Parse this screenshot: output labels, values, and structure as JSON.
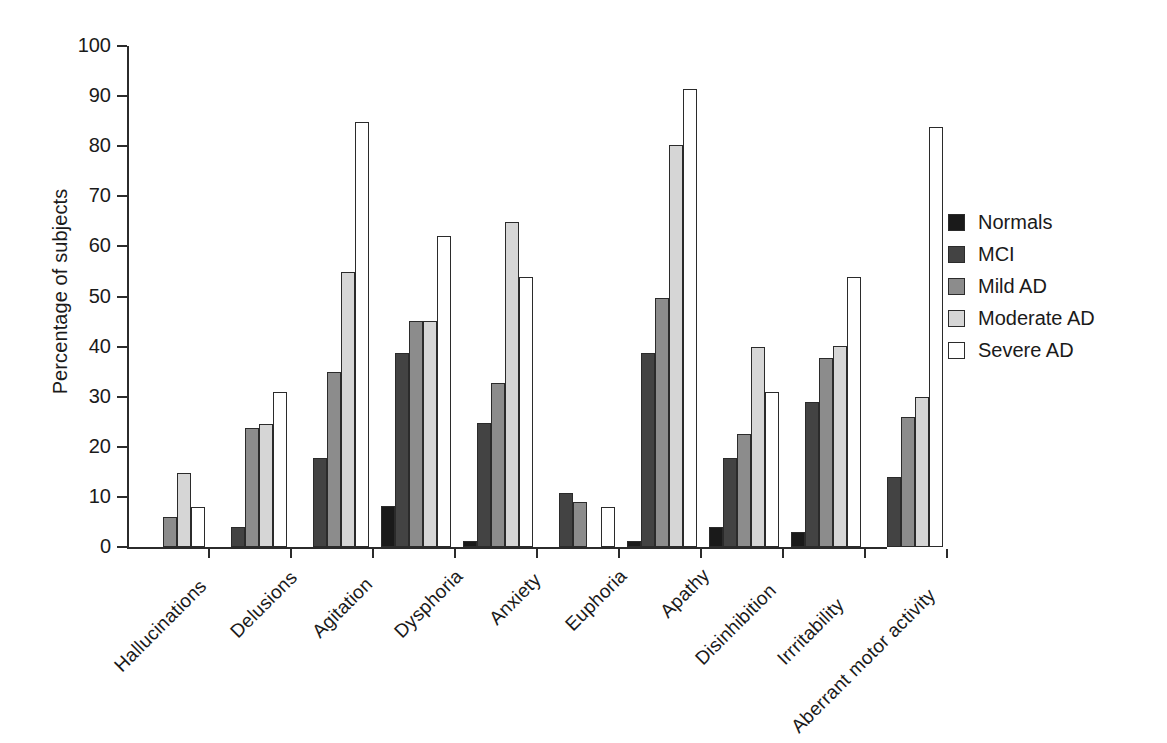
{
  "chart_data": {
    "type": "bar",
    "title": "",
    "subtitle": "",
    "xlabel": "",
    "ylabel": "Percentage of subjects",
    "ylim": [
      0,
      100
    ],
    "yticks": [
      0,
      10,
      20,
      30,
      40,
      50,
      60,
      70,
      80,
      90,
      100
    ],
    "grid": false,
    "legend_position": "right",
    "categories": [
      "Hallucinations",
      "Delusions",
      "Agitation",
      "Dysphoria",
      "Anxiety",
      "Euphoria",
      "Apathy",
      "Disinhibition",
      "Irrritability",
      "Aberrant motor activity"
    ],
    "series": [
      {
        "name": "Normals",
        "color": "#1a1a1a",
        "values": [
          0,
          0,
          0,
          8.2,
          1.3,
          0,
          1.3,
          3.9,
          3.0,
          0
        ]
      },
      {
        "name": "MCI",
        "color": "#434343",
        "values": [
          0,
          3.9,
          17.8,
          38.8,
          24.7,
          10.7,
          38.8,
          17.8,
          28.9,
          14.0
        ]
      },
      {
        "name": "Mild AD",
        "color": "#8c8c8c",
        "values": [
          5.9,
          23.8,
          34.9,
          45.1,
          32.8,
          9.0,
          49.7,
          22.6,
          37.7,
          25.9
        ]
      },
      {
        "name": "Moderate AD",
        "color": "#d6d6d6",
        "values": [
          14.8,
          24.6,
          54.9,
          45.2,
          64.9,
          0,
          80.3,
          40.0,
          40.1,
          30.0
        ]
      },
      {
        "name": "Severe AD",
        "color": "#ffffff",
        "values": [
          8.0,
          31.0,
          84.9,
          62.0,
          53.9,
          8.0,
          91.5,
          31.0,
          53.9,
          83.8
        ]
      }
    ]
  },
  "axes": {
    "y_title": "Percentage of subjects",
    "y_tick_labels": [
      "0",
      "10",
      "20",
      "30",
      "40",
      "50",
      "60",
      "70",
      "80",
      "90",
      "100"
    ],
    "x_tick_labels": [
      "Hallucinations",
      "Delusions",
      "Agitation",
      "Dysphoria",
      "Anxiety",
      "Euphoria",
      "Apathy",
      "Disinhibition",
      "Irrritability",
      "Aberrant motor activity"
    ]
  },
  "legend": {
    "items": [
      {
        "label": "Normals",
        "color": "#1a1a1a"
      },
      {
        "label": "MCI",
        "color": "#434343"
      },
      {
        "label": "Mild AD",
        "color": "#8c8c8c"
      },
      {
        "label": "Moderate AD",
        "color": "#d6d6d6"
      },
      {
        "label": "Severe AD",
        "color": "#ffffff"
      }
    ]
  },
  "colors": {
    "axis": "#2b2b2b",
    "text": "#1a1a1a",
    "background": "#ffffff"
  }
}
